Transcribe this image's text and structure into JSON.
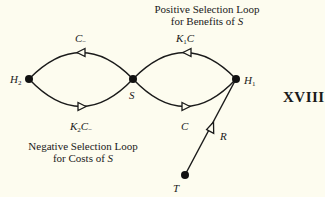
{
  "diagram": {
    "figure_number": "XVIII",
    "background_color": "#fdfcef",
    "line_color": "#1a1a1a",
    "nodes": [
      {
        "id": "H2",
        "label": "H",
        "subscript": "2"
      },
      {
        "id": "S",
        "label": "S"
      },
      {
        "id": "H1",
        "label": "H",
        "subscript": "1"
      },
      {
        "id": "T",
        "label": "T"
      }
    ],
    "edges": [
      {
        "from": "S",
        "to": "H2",
        "label": "C",
        "label_subscript": "−",
        "position": "upper-left arc"
      },
      {
        "from": "H2",
        "to": "S",
        "label_prefix": "K",
        "label_prefix_subscript": "2",
        "label": "C",
        "label_subscript": "−",
        "position": "lower-left arc"
      },
      {
        "from": "H1",
        "to": "S",
        "label_prefix": "K",
        "label_prefix_subscript": "1",
        "label": "C",
        "position": "upper-right arc"
      },
      {
        "from": "S",
        "to": "H1",
        "label": "C",
        "position": "lower-right arc"
      },
      {
        "from": "T",
        "to": "H1",
        "label": "R",
        "position": "straight line"
      }
    ],
    "captions": {
      "positive_line1": "Positive Selection Loop",
      "positive_line2_prefix": "for Benefits of ",
      "positive_line2_var": "S",
      "negative_line1": "Negative Selection Loop",
      "negative_line2_prefix": "for Costs of ",
      "negative_line2_var": "S"
    },
    "labels": {
      "h2_main": "H",
      "h2_sub": "2",
      "h1_main": "H",
      "h1_sub": "1",
      "s": "S",
      "t": "T",
      "r": "R",
      "c_minus_main": "C",
      "c_minus_sub": "−",
      "k2_main": "K",
      "k2_sub": "2",
      "k2_c": "C",
      "k2_c_sub": "−",
      "k1_main": "K",
      "k1_sub": "1",
      "k1_c": "C",
      "c_main": "C"
    }
  }
}
